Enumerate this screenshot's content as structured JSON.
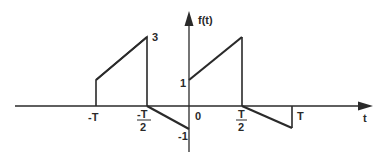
{
  "diagram": {
    "title": "f(t)",
    "axis_labels": {
      "x": "t",
      "y": "f(t)"
    },
    "x_ticks": [
      {
        "label": "-T",
        "value": "-T"
      },
      {
        "label_num": "-T",
        "label_den": "2",
        "value": "-T/2"
      },
      {
        "label": "0",
        "value": "0"
      },
      {
        "label_num": "T",
        "label_den": "2",
        "value": "T/2"
      },
      {
        "label": "T",
        "value": "T"
      }
    ],
    "y_ticks": [
      {
        "label": "3",
        "value": 3
      },
      {
        "label": "1",
        "value": 1
      },
      {
        "label": "-1",
        "value": -1
      }
    ],
    "segments": [
      {
        "from": [
          "-T",
          0
        ],
        "to": [
          "-T",
          1
        ],
        "type": "vertical"
      },
      {
        "from": [
          "-T",
          1
        ],
        "to": [
          "-T/2",
          3
        ],
        "type": "ramp"
      },
      {
        "from": [
          "-T/2",
          3
        ],
        "to": [
          "-T/2",
          0
        ],
        "type": "vertical"
      },
      {
        "from": [
          "-T/2",
          0
        ],
        "to": [
          "0",
          -1
        ],
        "type": "ramp"
      },
      {
        "from": [
          "0",
          1
        ],
        "to": [
          "T/2",
          3
        ],
        "type": "ramp"
      },
      {
        "from": [
          "T/2",
          3
        ],
        "to": [
          "T/2",
          0
        ],
        "type": "vertical"
      },
      {
        "from": [
          "T/2",
          0
        ],
        "to": [
          "T",
          -1
        ],
        "type": "ramp"
      },
      {
        "from": [
          "T",
          -1
        ],
        "to": [
          "T",
          0
        ],
        "type": "vertical"
      }
    ],
    "colors": {
      "line": "#2a2a2a",
      "background": "#ffffff"
    }
  }
}
